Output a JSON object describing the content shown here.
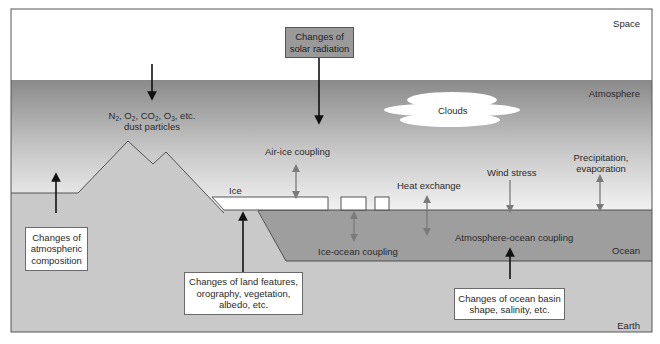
{
  "diagram": {
    "type": "climate-system-schematic",
    "regions": {
      "space": "Space",
      "atmosphere": "Atmosphere",
      "ocean": "Ocean",
      "earth": "Earth"
    },
    "features": {
      "clouds": "Clouds",
      "ice": "Ice"
    },
    "atmospheric_composition": {
      "gases": [
        "N",
        "2",
        ", O",
        "2",
        ", CO",
        "2",
        ", O",
        "3",
        ", etc."
      ],
      "line2": "dust particles"
    },
    "interactions": {
      "air_ice": "Air-ice coupling",
      "heat_exchange": "Heat exchange",
      "wind_stress": "Wind stress",
      "precip_line1": "Precipitation,",
      "precip_line2": "evaporation",
      "ice_ocean": "Ice-ocean coupling",
      "atmosphere_ocean": "Atmosphere-ocean coupling"
    },
    "forcing_boxes": {
      "solar": {
        "line1": "Changes of",
        "line2": "solar radiation"
      },
      "atmospheric": {
        "line1": "Changes of",
        "line2": "atmospheric",
        "line3": "composition"
      },
      "land": {
        "line1": "Changes of land features,",
        "line2": "orography, vegetation,",
        "line3": "albedo, etc."
      },
      "ocean": {
        "line1": "Changes of ocean basin",
        "line2": "shape, salinity, etc."
      }
    },
    "colors": {
      "space": "#ffffff",
      "atmosphere_top": "#8a8a8a",
      "atmosphere_bottom": "#f2f2f2",
      "land": "#c8c8c8",
      "ocean": "#9e9e9e",
      "ice": "#ffffff",
      "solar_box": "#9a9a9a",
      "arrow_dark": "#111111",
      "arrow_light": "#7a7a7a"
    }
  }
}
